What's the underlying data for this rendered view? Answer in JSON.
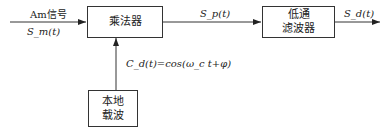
{
  "input": {
    "label": "Am信号",
    "signal": "S_m(t)"
  },
  "multiplier": {
    "label": "乘法器"
  },
  "mid_signal": "S_p(t)",
  "lpf": {
    "line1": "低通",
    "line2": "滤波器"
  },
  "output_signal": "S_d(t)",
  "carrier": {
    "expr": "C_d(t)=cos(ω_c t+φ)"
  },
  "local_osc": {
    "line1": "本地",
    "line2": "载波"
  }
}
